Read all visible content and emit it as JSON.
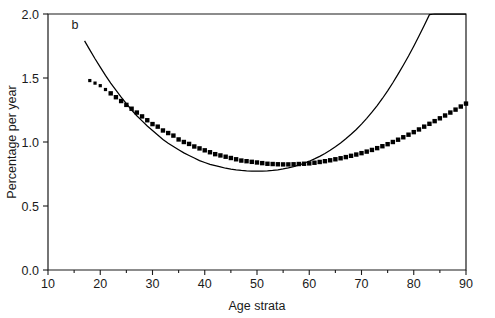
{
  "figure": {
    "panel_label": "b",
    "background_color": "#ffffff",
    "ink_color": "#1a1a1a"
  },
  "chart_data": {
    "type": "line",
    "title": "",
    "subtitle": "",
    "xlabel": "Age strata",
    "ylabel": "Percentage per year",
    "xlim": [
      10,
      90
    ],
    "ylim": [
      0.0,
      2.0
    ],
    "x_major_ticks": [
      10,
      20,
      30,
      40,
      50,
      60,
      70,
      80,
      90
    ],
    "x_minor_ticks": [
      15,
      25,
      35,
      45,
      55,
      65,
      75,
      85
    ],
    "y_major_ticks": [
      0.0,
      0.5,
      1.0,
      1.5,
      2.0
    ],
    "x_tick_labels": [
      "10",
      "20",
      "30",
      "40",
      "50",
      "60",
      "70",
      "80",
      "90"
    ],
    "y_tick_labels": [
      "0.0",
      "0.5",
      "1.0",
      "1.5",
      "2.0"
    ],
    "grid": false,
    "legend": false,
    "legend_position": "none",
    "annotations": [
      {
        "text": "b",
        "x": 14.5,
        "y": 1.88
      }
    ],
    "series": [
      {
        "name": "observed-points",
        "style": "square-markers",
        "marker": "square",
        "marker_color": "#000000",
        "x": [
          18,
          19,
          20,
          21,
          22,
          23,
          24,
          25,
          26,
          27,
          28,
          29,
          30,
          31,
          32,
          33,
          34,
          35,
          36,
          37,
          38,
          39,
          40,
          41,
          42,
          43,
          44,
          45,
          46,
          47,
          48,
          49,
          50,
          51,
          52,
          53,
          54,
          55,
          56,
          57,
          58,
          59,
          60,
          61,
          62,
          63,
          64,
          65,
          66,
          67,
          68,
          69,
          70,
          71,
          72,
          73,
          74,
          75,
          76,
          77,
          78,
          79,
          80,
          81,
          82,
          83,
          84,
          85,
          86,
          87,
          88,
          89,
          90
        ],
        "y": [
          1.48,
          1.46,
          1.44,
          1.41,
          1.38,
          1.35,
          1.32,
          1.29,
          1.26,
          1.23,
          1.2,
          1.17,
          1.14,
          1.12,
          1.09,
          1.07,
          1.05,
          1.02,
          1.0,
          0.985,
          0.965,
          0.95,
          0.935,
          0.92,
          0.905,
          0.895,
          0.885,
          0.875,
          0.865,
          0.855,
          0.85,
          0.845,
          0.84,
          0.835,
          0.83,
          0.828,
          0.826,
          0.825,
          0.825,
          0.826,
          0.828,
          0.83,
          0.833,
          0.838,
          0.844,
          0.85,
          0.857,
          0.865,
          0.873,
          0.882,
          0.892,
          0.902,
          0.913,
          0.925,
          0.938,
          0.952,
          0.967,
          0.983,
          1.0,
          1.018,
          1.037,
          1.057,
          1.077,
          1.098,
          1.12,
          1.142,
          1.163,
          1.185,
          1.207,
          1.23,
          1.253,
          1.277,
          1.3
        ]
      },
      {
        "name": "fitted-curve",
        "style": "smooth-line",
        "line_color": "#000000",
        "x": [
          17,
          18,
          19,
          20,
          21,
          22,
          23,
          24,
          25,
          26,
          27,
          28,
          29,
          30,
          31,
          32,
          33,
          34,
          35,
          36,
          37,
          38,
          39,
          40,
          41,
          42,
          43,
          44,
          45,
          46,
          47,
          48,
          49,
          50,
          51,
          52,
          53,
          54,
          55,
          56,
          57,
          58,
          59,
          60,
          61,
          62,
          63,
          64,
          65,
          66,
          67,
          68,
          69,
          70,
          71,
          72,
          73,
          74,
          75,
          76,
          77,
          78,
          79,
          80,
          81,
          82,
          83,
          84,
          85,
          86,
          87,
          88,
          89,
          90
        ],
        "y": [
          1.79,
          1.72,
          1.65,
          1.585,
          1.52,
          1.46,
          1.405,
          1.35,
          1.3,
          1.25,
          1.205,
          1.165,
          1.125,
          1.09,
          1.055,
          1.02,
          0.99,
          0.965,
          0.94,
          0.915,
          0.895,
          0.875,
          0.855,
          0.84,
          0.825,
          0.815,
          0.805,
          0.795,
          0.788,
          0.782,
          0.778,
          0.775,
          0.773,
          0.772,
          0.773,
          0.775,
          0.778,
          0.783,
          0.79,
          0.798,
          0.808,
          0.82,
          0.834,
          0.85,
          0.868,
          0.888,
          0.91,
          0.935,
          0.962,
          0.992,
          1.025,
          1.06,
          1.098,
          1.14,
          1.185,
          1.233,
          1.285,
          1.34,
          1.4,
          1.463,
          1.53,
          1.6,
          1.672,
          1.748,
          1.828,
          1.91,
          1.995,
          2.0,
          2.0,
          2.0,
          2.0,
          2.0,
          2.0,
          2.0
        ]
      }
    ]
  }
}
